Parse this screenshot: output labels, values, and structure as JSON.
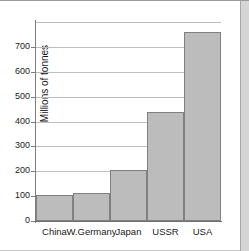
{
  "chart_data": {
    "type": "bar",
    "title": "",
    "xlabel": "",
    "ylabel": "Millions of tonnes",
    "categories": [
      "China",
      "W.Germany",
      "Japan",
      "USSR",
      "USA"
    ],
    "values": [
      105,
      113,
      205,
      440,
      760
    ],
    "ylim": [
      0,
      800
    ],
    "ytick_labels": [
      "0",
      "100",
      "200",
      "300",
      "400",
      "500",
      "600",
      "700"
    ],
    "ytick_values": [
      0,
      100,
      200,
      300,
      400,
      500,
      600,
      700
    ],
    "gridlines": [
      0,
      100,
      200,
      300,
      400,
      500,
      600,
      700,
      800
    ],
    "grid": true,
    "legend": "none",
    "bar_fill_color": "#bcbcbc",
    "bar_border_color": "#808080",
    "gridline_color": "#bdbdbd",
    "axis_color": "#7d7d7d"
  }
}
